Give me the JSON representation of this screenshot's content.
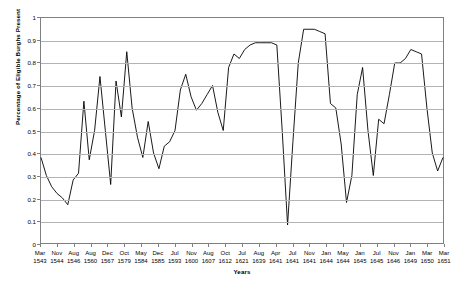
{
  "chart_data": {
    "type": "line",
    "title": "",
    "xlabel": "Years",
    "ylabel": "Percentage of Eligible Burghs Present",
    "ylim": [
      0,
      1
    ],
    "ytick_labels": [
      "1",
      "0.9",
      "0.8",
      "0.7",
      "0.6",
      "0.5",
      "0.4",
      "0.3",
      "0.2",
      "0.1",
      "0"
    ],
    "ytick_values": [
      1,
      0.9,
      0.8,
      0.7,
      0.6,
      0.5,
      0.4,
      0.3,
      0.2,
      0.1,
      0
    ],
    "grid": true,
    "legend": "none",
    "xtick_labels": [
      {
        "month": "Mar",
        "year": "1543"
      },
      {
        "month": "Nov",
        "year": "1544"
      },
      {
        "month": "Aug",
        "year": "1546"
      },
      {
        "month": "Aug",
        "year": "1560"
      },
      {
        "month": "Dec",
        "year": "1567"
      },
      {
        "month": "Oct",
        "year": "1579"
      },
      {
        "month": "May",
        "year": "1584"
      },
      {
        "month": "Dec",
        "year": "1585"
      },
      {
        "month": "Jul",
        "year": "1593"
      },
      {
        "month": "Nov",
        "year": "1600"
      },
      {
        "month": "Aug",
        "year": "1607"
      },
      {
        "month": "Oct",
        "year": "1612"
      },
      {
        "month": "Jul",
        "year": "1621"
      },
      {
        "month": "Aug",
        "year": "1639"
      },
      {
        "month": "Apr",
        "year": "1641"
      },
      {
        "month": "Jul",
        "year": "1641"
      },
      {
        "month": "Nov",
        "year": "1641"
      },
      {
        "month": "Jan",
        "year": "1644"
      },
      {
        "month": "May",
        "year": "1644"
      },
      {
        "month": "Jan",
        "year": "1645"
      },
      {
        "month": "Jul",
        "year": "1645"
      },
      {
        "month": "Nov",
        "year": "1646"
      },
      {
        "month": "Jan",
        "year": "1649"
      },
      {
        "month": "Mar",
        "year": "1650"
      },
      {
        "month": "Mar",
        "year": "1651"
      }
    ],
    "series": [
      {
        "name": "Percentage of Eligible Burghs Present",
        "color": "#000000",
        "values": [
          0.38,
          0.3,
          0.25,
          0.22,
          0.2,
          0.17,
          0.28,
          0.31,
          0.63,
          0.37,
          0.5,
          0.74,
          0.5,
          0.26,
          0.72,
          0.56,
          0.85,
          0.6,
          0.47,
          0.38,
          0.54,
          0.4,
          0.33,
          0.43,
          0.45,
          0.5,
          0.68,
          0.75,
          0.65,
          0.59,
          0.62,
          0.66,
          0.7,
          0.58,
          0.5,
          0.78,
          0.84,
          0.82,
          0.86,
          0.88,
          0.89,
          0.89,
          0.89,
          0.89,
          0.88,
          0.5,
          0.08,
          0.45,
          0.8,
          0.95,
          0.95,
          0.95,
          0.94,
          0.93,
          0.62,
          0.6,
          0.44,
          0.18,
          0.3,
          0.66,
          0.78,
          0.5,
          0.3,
          0.55,
          0.53,
          0.66,
          0.8,
          0.8,
          0.82,
          0.86,
          0.85,
          0.84,
          0.6,
          0.4,
          0.32,
          0.38
        ]
      }
    ],
    "annotations": []
  },
  "axis": {
    "y_title": "Percentage of Eligible Burghs Present",
    "x_title": "Years"
  }
}
